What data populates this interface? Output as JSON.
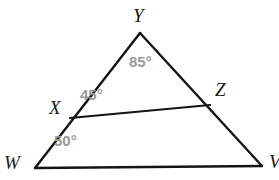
{
  "figure": {
    "type": "geometry-triangle-diagram",
    "stroke_color": "#141414",
    "stroke_width": 2.4,
    "angle_text_color": "#9a9a9a",
    "vertex_text_color": "#1a1a1a",
    "background": "#ffffff"
  },
  "vertices": [
    {
      "id": "Y",
      "label": "Y",
      "x": 140,
      "y": 33
    },
    {
      "id": "W",
      "label": "W",
      "x": 35,
      "y": 168
    },
    {
      "id": "V",
      "label": "V",
      "x": 262,
      "y": 166
    },
    {
      "id": "X",
      "label": "X",
      "x": 70,
      "y": 118
    },
    {
      "id": "Z",
      "label": "Z",
      "x": 210,
      "y": 105
    }
  ],
  "segments": [
    {
      "id": "YW",
      "from": "Y",
      "to": "W"
    },
    {
      "id": "YV",
      "from": "Y",
      "to": "V"
    },
    {
      "id": "WV",
      "from": "W",
      "to": "V"
    },
    {
      "id": "XZ",
      "from": "X",
      "to": "Z"
    }
  ],
  "angles": [
    {
      "id": "angle-Y",
      "at_vertex": "Y",
      "value": 85,
      "label": "85°"
    },
    {
      "id": "angle-X",
      "at_vertex": "X",
      "value": 45,
      "label": "45°"
    },
    {
      "id": "angle-W",
      "at_vertex": "W",
      "value": 50,
      "label": "50°"
    }
  ],
  "labels": {
    "Y": "Y",
    "X": "X",
    "Z": "Z",
    "W": "W",
    "V": "V",
    "angle_Y": "85°",
    "angle_X": "45°",
    "angle_W": "50°"
  }
}
